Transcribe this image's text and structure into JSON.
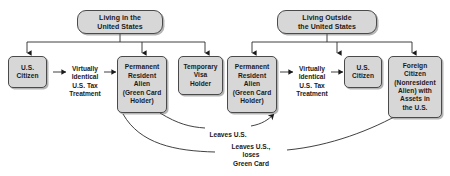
{
  "diagram": {
    "background_color": "#ffffff",
    "node_fill_color": "#d7d7d7",
    "node_border_color": "#4a4a4a",
    "text_color": "#1a1a1a",
    "headers": [
      {
        "id": "living-in-us",
        "label": "Living in the\nUnited States"
      },
      {
        "id": "living-outside-us",
        "label": "Living Outside\nthe United States"
      }
    ],
    "nodes": [
      {
        "id": "us-citizen-left",
        "label": "U.S.\nCitizen"
      },
      {
        "id": "permanent-resident-alien-left",
        "label": "Permanent\nResident\nAlien\n(Green Card\nHolder)"
      },
      {
        "id": "temporary-visa-holder",
        "label": "Temporary\nVisa\nHolder"
      },
      {
        "id": "permanent-resident-alien-right",
        "label": "Permanent\nResident\nAlien\n(Green Card\nHolder)"
      },
      {
        "id": "us-citizen-right",
        "label": "U.S.\nCitizen"
      },
      {
        "id": "foreign-citizen",
        "label": "Foreign\nCitizen\n(Nonresident\nAlien) with\nAssets in\nthe U.S."
      }
    ],
    "edge_labels": [
      {
        "id": "virtually-identical-left",
        "label": "Virtually\nIdentical\nU.S. Tax\nTreatment"
      },
      {
        "id": "virtually-identical-right",
        "label": "Virtually\nIdentical\nU.S. Tax\nTreatment"
      },
      {
        "id": "leaves-us",
        "label": "Leaves U.S."
      },
      {
        "id": "leaves-us-loses-green-card",
        "label": "Leaves U.S.,\nloses\nGreen Card"
      }
    ]
  }
}
